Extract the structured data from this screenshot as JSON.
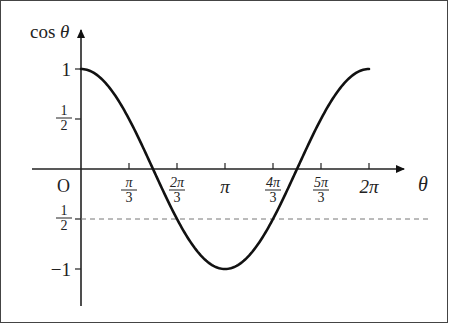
{
  "chart_data": {
    "type": "line",
    "title": "",
    "xlabel": "θ",
    "ylabel": "cos θ",
    "origin_label": "O",
    "x_ticks": [
      {
        "label_num": "π",
        "label_den": "3",
        "value": 1.0472
      },
      {
        "label_num": "2π",
        "label_den": "3",
        "value": 2.0944
      },
      {
        "label": "π",
        "value": 3.1416
      },
      {
        "label_num": "4π",
        "label_den": "3",
        "value": 4.1888
      },
      {
        "label_num": "5π",
        "label_den": "3",
        "value": 5.236
      },
      {
        "label": "2π",
        "value": 6.2832
      }
    ],
    "y_ticks": [
      {
        "label": "1",
        "value": 1
      },
      {
        "label_num": "1",
        "label_den": "2",
        "value": 0.5
      },
      {
        "label_num": "1",
        "label_den": "2",
        "value": -0.5
      },
      {
        "label": "−1",
        "value": -1
      }
    ],
    "series": [
      {
        "name": "cos θ",
        "function": "cos",
        "x_range": [
          0,
          6.2832
        ]
      }
    ],
    "reference_lines": [
      {
        "type": "horizontal",
        "y": -0.5,
        "style": "dashed"
      }
    ],
    "xlim": [
      0,
      6.8
    ],
    "ylim": [
      -1.3,
      1.3
    ],
    "grid": false,
    "legend": "none"
  }
}
